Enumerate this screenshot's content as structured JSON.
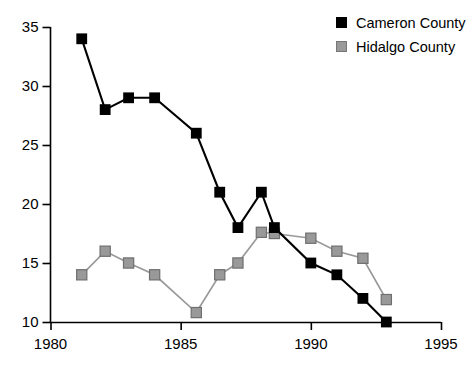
{
  "chart_data": {
    "type": "line",
    "title": "",
    "xlabel": "",
    "ylabel": "",
    "xlim": [
      1980,
      1995
    ],
    "ylim": [
      10,
      35
    ],
    "xticks": [
      1980,
      1985,
      1990,
      1995
    ],
    "yticks": [
      10,
      15,
      20,
      25,
      30,
      35
    ],
    "grid": false,
    "legend_position": "top-right",
    "series": [
      {
        "name": "Cameron County",
        "color": "#000000",
        "marker": "square-filled",
        "x": [
          1981.2,
          1982.1,
          1983.0,
          1984.0,
          1985.6,
          1986.5,
          1987.2,
          1988.1,
          1988.6,
          1990.0,
          1991.0,
          1992.0,
          1992.9
        ],
        "values": [
          34,
          28,
          29,
          29,
          26,
          21,
          18,
          21,
          18,
          15,
          14,
          12,
          10
        ]
      },
      {
        "name": "Hidalgo County",
        "color": "#999999",
        "marker": "square-gray",
        "x": [
          1981.2,
          1982.1,
          1983.0,
          1984.0,
          1985.6,
          1986.5,
          1987.2,
          1988.1,
          1988.6,
          1990.0,
          1991.0,
          1992.0,
          1992.9
        ],
        "values": [
          14,
          16,
          15,
          14,
          10.8,
          14,
          15,
          17.6,
          17.5,
          17.1,
          16,
          15.4,
          11.9
        ]
      }
    ]
  },
  "legend": {
    "items": [
      {
        "label": "Cameron County",
        "color": "#000000"
      },
      {
        "label": "Hidalgo County",
        "color": "#999999"
      }
    ]
  },
  "axes": {
    "y_tick_labels": [
      "35",
      "30",
      "25",
      "20",
      "15",
      "10"
    ],
    "x_tick_labels": [
      "1980",
      "1985",
      "1990",
      "1995"
    ]
  }
}
